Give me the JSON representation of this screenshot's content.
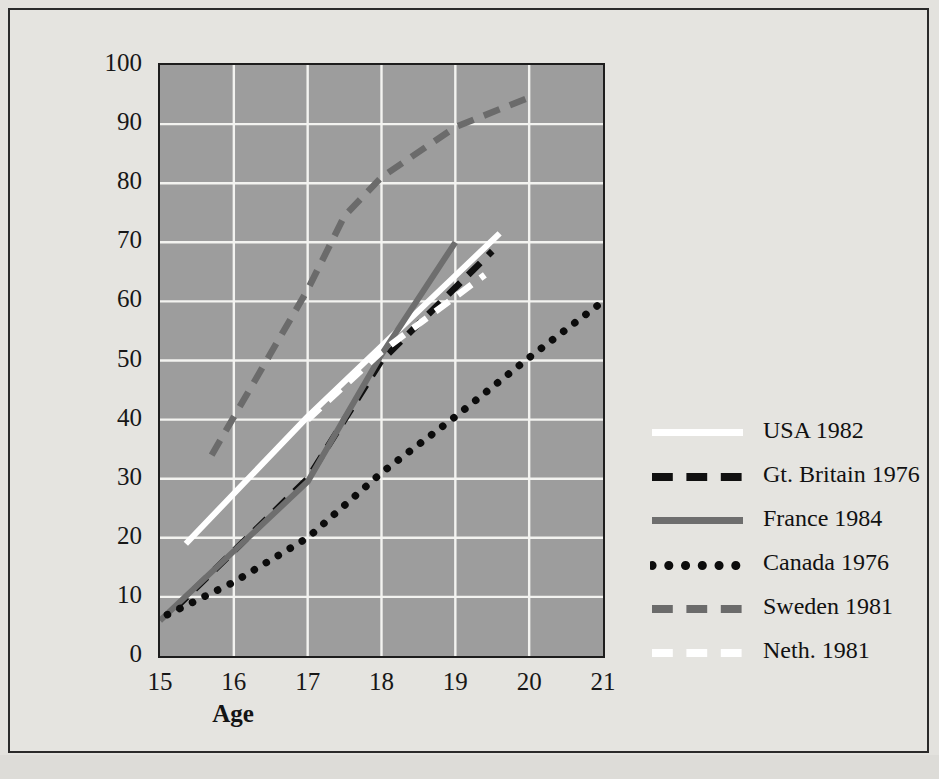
{
  "chart_data": {
    "type": "line",
    "title": "",
    "xlabel": "Age",
    "ylabel": "Percent",
    "xlim": [
      15,
      21
    ],
    "ylim": [
      0,
      100
    ],
    "xticks": [
      "15",
      "16",
      "17",
      "18",
      "19",
      "20",
      "21"
    ],
    "yticks": [
      "0",
      "10",
      "20",
      "30",
      "40",
      "50",
      "60",
      "70",
      "80",
      "90",
      "100"
    ],
    "grid": true,
    "legend_position": "right",
    "plot_bg_color": "#9d9d9d",
    "gridline_color": "#f3f3f0",
    "page_bg_color": "#e5e4e0",
    "series": [
      {
        "name": "USA 1982",
        "style": "solid",
        "color": "#ffffff",
        "x": [
          15.35,
          17.0,
          19.6
        ],
        "y": [
          19.0,
          40.5,
          71.5
        ]
      },
      {
        "name": "Gt. Britain 1976",
        "style": "dashed",
        "color": "#101010",
        "x": [
          15.2,
          17.0,
          18.0,
          19.5
        ],
        "y": [
          8.0,
          30.0,
          50.0,
          68.5
        ]
      },
      {
        "name": "France 1984",
        "style": "solid",
        "color": "#6e6e6e",
        "x": [
          15.0,
          17.0,
          18.0,
          19.0
        ],
        "y": [
          6.0,
          29.5,
          51.0,
          70.0
        ]
      },
      {
        "name": "Canada 1976",
        "style": "dotted",
        "color": "#0c0c0c",
        "x": [
          15.1,
          16.0,
          17.0,
          18.0,
          19.0,
          20.0,
          21.0
        ],
        "y": [
          7.0,
          12.5,
          20.0,
          31.0,
          40.5,
          50.5,
          60.0
        ]
      },
      {
        "name": "Sweden 1981",
        "style": "dashed",
        "color": "#6b6b6b",
        "x": [
          15.7,
          17.0,
          17.5,
          18.0,
          19.0,
          20.0
        ],
        "y": [
          34.0,
          62.0,
          74.5,
          81.0,
          89.5,
          94.5
        ]
      },
      {
        "name": "Neth. 1981",
        "style": "dashed",
        "color": "#ffffff",
        "x": [
          17.0,
          18.0,
          19.4
        ],
        "y": [
          40.0,
          51.5,
          64.5
        ]
      }
    ]
  },
  "axes": {
    "xlabel": "Age",
    "ylabel": "Percent"
  },
  "legend": {
    "items": [
      {
        "label": "USA 1982"
      },
      {
        "label": "Gt. Britain 1976"
      },
      {
        "label": "France 1984"
      },
      {
        "label": "Canada 1976"
      },
      {
        "label": "Sweden 1981"
      },
      {
        "label": "Neth. 1981"
      }
    ]
  }
}
